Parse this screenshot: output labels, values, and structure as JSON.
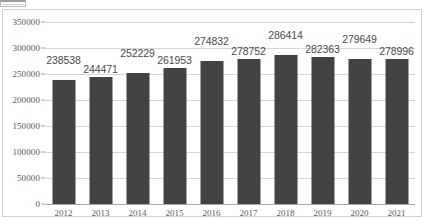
{
  "chart_data": {
    "type": "bar",
    "title": "",
    "xlabel": "",
    "ylabel": "",
    "categories": [
      "2012",
      "2013",
      "2014",
      "2015",
      "2016",
      "2017",
      "2018",
      "2019",
      "2020",
      "2021"
    ],
    "values": [
      238538,
      244471,
      252229,
      261953,
      274832,
      278752,
      286414,
      282363,
      279649,
      278996
    ],
    "data_labels": [
      "238538",
      "244471",
      "252229",
      "261953",
      "274832",
      "278752",
      "286414",
      "282363",
      "279649",
      "278996"
    ],
    "ylim": [
      0,
      350000
    ],
    "yticks": [
      0,
      50000,
      100000,
      150000,
      200000,
      250000,
      300000,
      350000
    ],
    "ytick_labels": [
      "0",
      "50000",
      "100000",
      "150000",
      "200000",
      "250000",
      "300000",
      "350000"
    ],
    "grid": true,
    "legend": "none",
    "bar_color": "#424242",
    "gridline_color": "#d6d6d6",
    "axis_color": "#a8a8a8",
    "label_color": "#4a4a4a",
    "frame_color": "#d2d2d2",
    "background": "#ffffff",
    "label_placement_alternating": true
  }
}
